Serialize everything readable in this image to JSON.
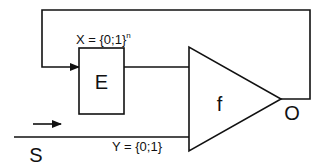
{
  "diagram": {
    "colors": {
      "stroke": "#111111",
      "background": "#ffffff"
    },
    "blocks": {
      "encoder": {
        "label": "E"
      },
      "function": {
        "label": "f"
      }
    },
    "labels": {
      "x_set": {
        "base": "X = {0;1}",
        "sup": "n"
      },
      "y_set": "Y = {0;1}",
      "input": "S",
      "output": "O"
    },
    "connections": [
      {
        "from": "O",
        "to": "E",
        "name": "feedback-loop"
      },
      {
        "from": "E",
        "to": "f",
        "name": "encoder-to-function"
      },
      {
        "from": "S",
        "to": "f",
        "name": "input-signal"
      }
    ]
  }
}
